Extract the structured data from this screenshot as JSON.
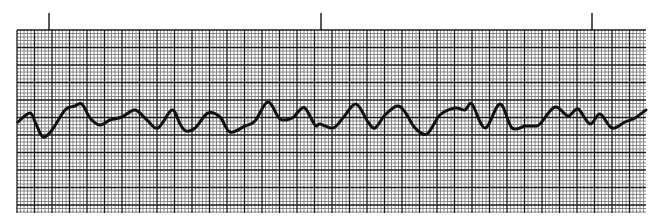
{
  "chart_data": {
    "type": "line",
    "title": "",
    "xlabel": "",
    "ylabel": "",
    "grid": {
      "on": true,
      "left": 17,
      "top": 30,
      "right": 646,
      "bottom": 213,
      "minor_spacing_px": 3.5,
      "major_every": 5,
      "minor_color": "#7a7a7a",
      "major_color": "#1a1a1a"
    },
    "time_markers": {
      "x": [
        49,
        321,
        592
      ],
      "y_top": 13,
      "y_bottom": 30
    },
    "trace_color": "#111111",
    "trace_width": 3,
    "points": [
      [
        18,
        122
      ],
      [
        30,
        113
      ],
      [
        36,
        124
      ],
      [
        43,
        137
      ],
      [
        52,
        130
      ],
      [
        65,
        110
      ],
      [
        75,
        106
      ],
      [
        82,
        104
      ],
      [
        90,
        118
      ],
      [
        100,
        125
      ],
      [
        110,
        120
      ],
      [
        122,
        117
      ],
      [
        135,
        110
      ],
      [
        147,
        120
      ],
      [
        158,
        128
      ],
      [
        172,
        110
      ],
      [
        180,
        124
      ],
      [
        186,
        131
      ],
      [
        195,
        128
      ],
      [
        208,
        113
      ],
      [
        220,
        117
      ],
      [
        230,
        132
      ],
      [
        245,
        126
      ],
      [
        255,
        121
      ],
      [
        268,
        102
      ],
      [
        280,
        119
      ],
      [
        292,
        118
      ],
      [
        298,
        112
      ],
      [
        305,
        108
      ],
      [
        315,
        125
      ],
      [
        320,
        124
      ],
      [
        333,
        128
      ],
      [
        343,
        118
      ],
      [
        356,
        104
      ],
      [
        368,
        122
      ],
      [
        375,
        128
      ],
      [
        385,
        115
      ],
      [
        397,
        106
      ],
      [
        405,
        112
      ],
      [
        415,
        128
      ],
      [
        427,
        134
      ],
      [
        440,
        115
      ],
      [
        455,
        108
      ],
      [
        465,
        110
      ],
      [
        472,
        104
      ],
      [
        485,
        128
      ],
      [
        500,
        104
      ],
      [
        512,
        128
      ],
      [
        525,
        126
      ],
      [
        535,
        126
      ],
      [
        540,
        124
      ],
      [
        555,
        107
      ],
      [
        568,
        116
      ],
      [
        578,
        109
      ],
      [
        590,
        124
      ],
      [
        600,
        114
      ],
      [
        612,
        128
      ],
      [
        625,
        122
      ],
      [
        635,
        118
      ],
      [
        646,
        110
      ]
    ]
  }
}
